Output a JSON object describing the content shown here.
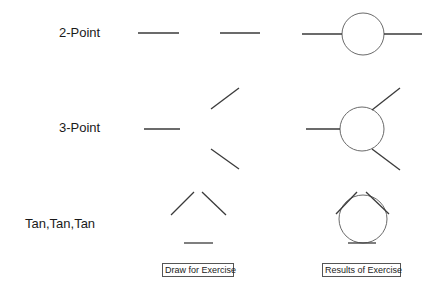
{
  "rows": [
    {
      "label": "2-Point"
    },
    {
      "label": "3-Point"
    },
    {
      "label": "Tan,Tan,Tan"
    }
  ],
  "captions": {
    "draw": "Draw for Exercise",
    "results": "Results of Exercise"
  },
  "colors": {
    "line": "#3a3a3a",
    "circle": "#6a6a6a"
  },
  "figures": {
    "two_point": {
      "draw_lines": [
        [
          138,
          33,
          179,
          33
        ],
        [
          220,
          33,
          260,
          33
        ]
      ],
      "result_lines": [
        [
          302,
          34,
          342,
          34
        ],
        [
          384,
          34,
          422,
          34
        ]
      ],
      "result_circle": [
        363,
        34,
        21
      ]
    },
    "three_point": {
      "draw_lines": [
        [
          144,
          129,
          180,
          129
        ],
        [
          211,
          109,
          239,
          88
        ],
        [
          211,
          149,
          239,
          169
        ]
      ],
      "result_lines": [
        [
          306,
          129,
          340,
          129
        ],
        [
          372,
          110,
          400,
          88
        ],
        [
          372,
          149,
          400,
          170
        ]
      ],
      "result_circle": [
        362,
        129,
        22
      ]
    },
    "tan_tan_tan": {
      "draw_lines": [
        [
          171,
          215,
          194,
          192
        ],
        [
          202,
          192,
          226,
          215
        ],
        [
          184,
          243,
          213,
          243
        ]
      ],
      "result_lines": [
        [
          336,
          214,
          357,
          192
        ],
        [
          366,
          192,
          389,
          214
        ],
        [
          348,
          243,
          376,
          243
        ]
      ],
      "result_circle": [
        363,
        219,
        24
      ]
    }
  }
}
